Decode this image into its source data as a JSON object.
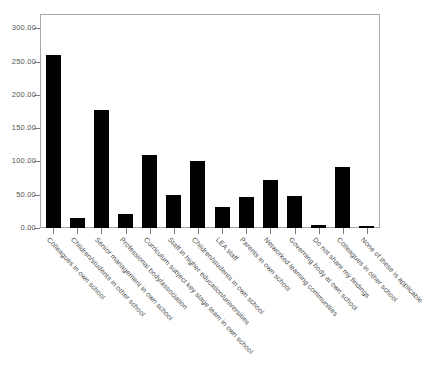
{
  "chart_data": {
    "type": "bar",
    "title": "",
    "subtitle": "",
    "xlabel": "",
    "ylabel": "",
    "ylim": [
      0,
      320
    ],
    "grid": false,
    "legend": null,
    "bar_color": "#000000",
    "frame_color": "#a8a8a8",
    "tick_label_color": "#545454",
    "yticks": [
      "0.00",
      "50.00",
      "100.00",
      "150.00",
      "200.00",
      "250.00",
      "300.00"
    ],
    "ytick_values": [
      0,
      50,
      100,
      150,
      200,
      250,
      300
    ],
    "categories": [
      "Colleagues in own school",
      "Children/students in other school",
      "Senior management in own school",
      "Professional body/association",
      "Curriculum subject key stage team in own school",
      "Staff in higher education/universities",
      "Children/students in own school",
      "LEA staff",
      "Parents in own school",
      "Networked learning communities",
      "Governing body at own school",
      "Do not share my findings",
      "Colleagues in other school",
      "None of these is applicable"
    ],
    "values": [
      260,
      15,
      178,
      21,
      110,
      50,
      100,
      32,
      47,
      72,
      48,
      4,
      92,
      2
    ]
  }
}
